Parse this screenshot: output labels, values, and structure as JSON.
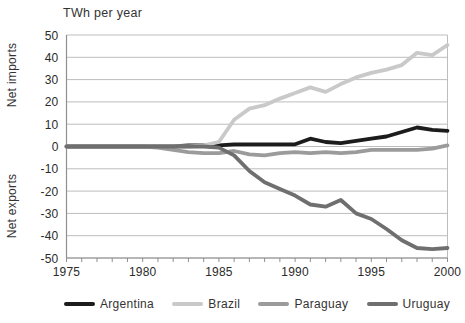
{
  "title": "TWh per year",
  "y_axis": {
    "top_label": "Net imports",
    "bottom_label": "Net exports"
  },
  "chart_data": {
    "type": "line",
    "title": "TWh per year",
    "xlabel": "",
    "ylabel_top": "Net imports",
    "ylabel_bottom": "Net exports",
    "xlim": [
      1975,
      2000
    ],
    "ylim": [
      -50,
      50
    ],
    "grid": true,
    "legend_position": "bottom",
    "x": [
      1975,
      1976,
      1977,
      1978,
      1979,
      1980,
      1981,
      1982,
      1983,
      1984,
      1985,
      1986,
      1987,
      1988,
      1989,
      1990,
      1991,
      1992,
      1993,
      1994,
      1995,
      1996,
      1997,
      1998,
      1999,
      2000
    ],
    "x_tick_labels": [
      "1975",
      "1980",
      "1985",
      "1990",
      "1995",
      "2000"
    ],
    "y_ticks": [
      50,
      40,
      30,
      20,
      10,
      0,
      -10,
      -20,
      -30,
      -40,
      -50
    ],
    "series": [
      {
        "name": "Argentina",
        "color": "#1c1c1c",
        "values": [
          0,
          0,
          0,
          0,
          0,
          0,
          0,
          0,
          0.5,
          0.5,
          0.5,
          1,
          1,
          1,
          1,
          1,
          3.5,
          2,
          1.5,
          2.5,
          3.5,
          4.5,
          6.5,
          8.5,
          7.5,
          7
        ]
      },
      {
        "name": "Brazil",
        "color": "#c9c9c9",
        "values": [
          0,
          0,
          0,
          0,
          0,
          0,
          0,
          0,
          0,
          0.5,
          2,
          12,
          17,
          18.5,
          21.5,
          24,
          26.5,
          24.5,
          28,
          31,
          33,
          34.5,
          36.5,
          42,
          41,
          45.5
        ]
      },
      {
        "name": "Paraguay",
        "color": "#9b9b9b",
        "values": [
          0,
          0,
          0,
          0,
          0,
          0,
          -0.5,
          -1.5,
          -2.5,
          -3,
          -3,
          -2,
          -3.5,
          -4,
          -3,
          -2.5,
          -3,
          -2.5,
          -3,
          -2.5,
          -1.5,
          -1.5,
          -1.5,
          -1.5,
          -1,
          0.5
        ]
      },
      {
        "name": "Uruguay",
        "color": "#6f6f6f",
        "values": [
          0,
          0,
          0,
          0,
          0,
          0,
          0,
          0,
          0,
          0,
          -0.5,
          -4,
          -11,
          -16,
          -19,
          -22,
          -26,
          -27,
          -24,
          -30,
          -32.5,
          -37,
          -42,
          -45.5,
          -46,
          -45.5
        ]
      }
    ]
  },
  "legend": {
    "items": [
      {
        "label": "Argentina",
        "color": "#1c1c1c"
      },
      {
        "label": "Brazil",
        "color": "#c9c9c9"
      },
      {
        "label": "Paraguay",
        "color": "#9b9b9b"
      },
      {
        "label": "Uruguay",
        "color": "#6f6f6f"
      }
    ]
  },
  "colors": {
    "background": "#ffffff",
    "gridline": "#bdbdbd",
    "axis": "#8f8f8f",
    "text": "#2b2b2b"
  }
}
